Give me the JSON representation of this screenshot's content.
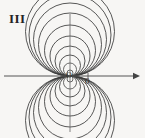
{
  "figure": {
    "panel_label": "III",
    "origin_label": "O",
    "x_tick_label": "0",
    "background_color": "#f7f6f4",
    "curve_color": "#3a3a3a",
    "axis_color": "#555555",
    "width": 145,
    "height": 138
  },
  "chart_data": {
    "type": "line",
    "title": "III",
    "subtitle": "",
    "xlabel": "",
    "ylabel": "",
    "grid": false,
    "legend": null,
    "axes": {
      "origin_px": [
        70,
        76
      ],
      "x_axis": {
        "from_px": [
          4,
          76
        ],
        "to_px": [
          140,
          76
        ],
        "arrow_at": "right",
        "tick_px": [
          88,
          76
        ],
        "tick_label": "0"
      },
      "y_axis": {
        "from_px": [
          70,
          14
        ],
        "to_px": [
          70,
          132
        ],
        "arrow_at": "none"
      },
      "xlim": [
        -66,
        70
      ],
      "ylim": [
        -56,
        62
      ]
    },
    "annotations": [
      {
        "text": "III",
        "x_px": 9,
        "y_px": 12
      },
      {
        "text": "O",
        "x_px": 66,
        "y_px": 72
      },
      {
        "text": "0",
        "x_px": 85,
        "y_px": 77
      }
    ],
    "series": [
      {
        "name": "upper-lobe-circle-1",
        "lobe": "upper",
        "center_px": [
          70,
          73.0
        ],
        "radius_px": 3.0
      },
      {
        "name": "upper-lobe-circle-2",
        "lobe": "upper",
        "center_px": [
          70,
          69.5
        ],
        "radius_px": 6.5
      },
      {
        "name": "upper-lobe-circle-3",
        "lobe": "upper",
        "center_px": [
          70,
          65.5
        ],
        "radius_px": 10.5
      },
      {
        "name": "upper-lobe-circle-4",
        "lobe": "upper",
        "center_px": [
          70,
          61.0
        ],
        "radius_px": 15.0
      },
      {
        "name": "upper-lobe-circle-5",
        "lobe": "upper",
        "center_px": [
          70,
          56.0
        ],
        "radius_px": 20.0
      },
      {
        "name": "upper-lobe-circle-6",
        "lobe": "upper",
        "center_px": [
          70,
          50.5
        ],
        "radius_px": 25.5
      },
      {
        "name": "upper-lobe-circle-7",
        "lobe": "upper",
        "center_px": [
          70,
          44.5
        ],
        "radius_px": 31.5
      },
      {
        "name": "upper-lobe-circle-8",
        "lobe": "upper",
        "center_px": [
          70,
          39.5
        ],
        "radius_px": 36.5
      },
      {
        "name": "upper-lobe-circle-9",
        "lobe": "upper",
        "center_px": [
          70,
          35.0
        ],
        "radius_px": 41.0
      },
      {
        "name": "upper-lobe-circle-10",
        "lobe": "upper",
        "center_px": [
          70,
          31.5
        ],
        "radius_px": 44.5
      },
      {
        "name": "lower-lobe-circle-1",
        "lobe": "lower",
        "center_px": [
          70,
          79.0
        ],
        "radius_px": 3.0
      },
      {
        "name": "lower-lobe-circle-2",
        "lobe": "lower",
        "center_px": [
          70,
          82.5
        ],
        "radius_px": 6.5
      },
      {
        "name": "lower-lobe-circle-3",
        "lobe": "lower",
        "center_px": [
          70,
          86.5
        ],
        "radius_px": 10.5
      },
      {
        "name": "lower-lobe-circle-4",
        "lobe": "lower",
        "center_px": [
          70,
          91.0
        ],
        "radius_px": 15.0
      },
      {
        "name": "lower-lobe-circle-5",
        "lobe": "lower",
        "center_px": [
          70,
          96.0
        ],
        "radius_px": 20.0
      },
      {
        "name": "lower-lobe-circle-6",
        "lobe": "lower",
        "center_px": [
          70,
          101.5
        ],
        "radius_px": 25.5
      },
      {
        "name": "lower-lobe-circle-7",
        "lobe": "lower",
        "center_px": [
          70,
          107.5
        ],
        "radius_px": 31.5
      },
      {
        "name": "lower-lobe-circle-8",
        "lobe": "lower",
        "center_px": [
          70,
          112.5
        ],
        "radius_px": 36.5
      },
      {
        "name": "lower-lobe-circle-9",
        "lobe": "lower",
        "center_px": [
          70,
          117.0
        ],
        "radius_px": 41.0
      },
      {
        "name": "lower-lobe-circle-10",
        "lobe": "lower",
        "center_px": [
          70,
          120.5
        ],
        "radius_px": 44.5
      }
    ]
  }
}
